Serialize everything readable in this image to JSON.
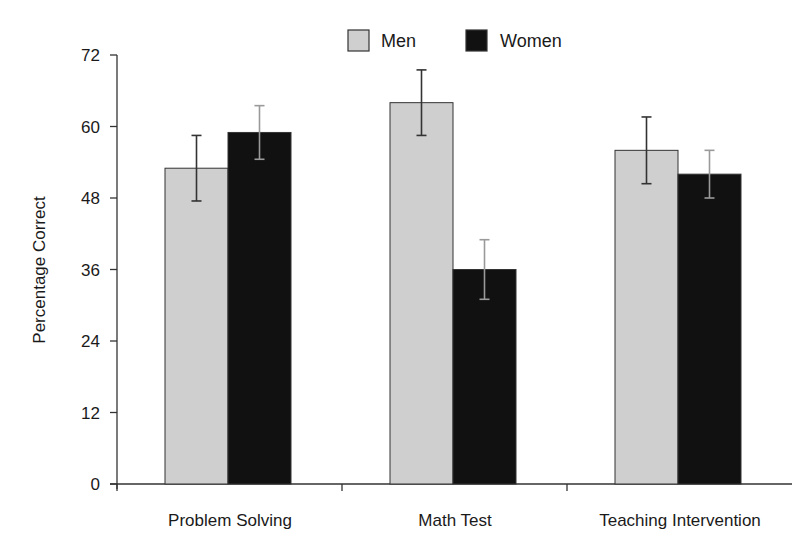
{
  "chart_data": {
    "type": "bar",
    "title": "",
    "xlabel": "",
    "ylabel": "Percentage Correct",
    "ylim": [
      0,
      72
    ],
    "yticks": [
      0,
      12,
      24,
      36,
      48,
      60,
      72
    ],
    "grid": false,
    "legend_position": "top-center",
    "categories": [
      "Problem Solving",
      "Math Test",
      "Teaching Intervention"
    ],
    "series": [
      {
        "name": "Men",
        "color": "#cfcfcf",
        "values": [
          53,
          64,
          56
        ],
        "error": [
          5.5,
          5.5,
          5.6
        ]
      },
      {
        "name": "Women",
        "color": "#111111",
        "values": [
          59,
          36,
          52
        ],
        "error": [
          4.5,
          5,
          4
        ]
      }
    ]
  }
}
